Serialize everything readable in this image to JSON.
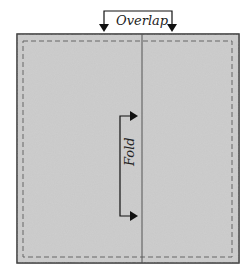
{
  "diagram": {
    "overlap_label": "Overlap",
    "fold_label": "Fold",
    "colors": {
      "fabric_fill": "#c9c9c9",
      "outline": "#333333",
      "dashed_line": "#666666",
      "fold_line": "#555555",
      "arrow": "#111111"
    }
  }
}
